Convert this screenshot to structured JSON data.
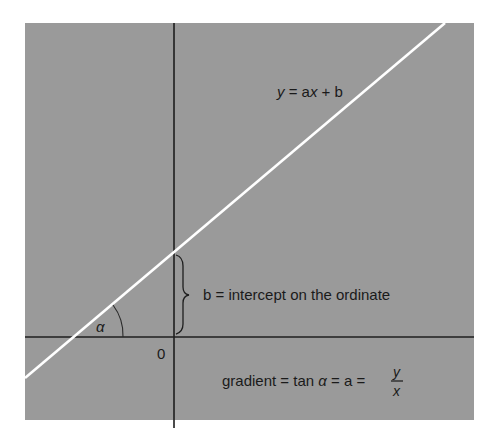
{
  "diagram": {
    "colors": {
      "panel": "#9a9a9a",
      "axis": "#1e1e1e",
      "line": "#ffffff",
      "text": "#1a1a1a",
      "background": "#ffffff"
    },
    "equation_label": {
      "y": "y",
      "eq": " = a",
      "x": "x",
      "rest": " + b"
    },
    "intercept_label": "b = intercept on the ordinate",
    "angle_label": "α",
    "origin_label": "0",
    "gradient_label": {
      "prefix": "gradient = tan ",
      "alpha": "α",
      "mid": " = a = ",
      "numerator": "y",
      "denominator": "x"
    }
  }
}
